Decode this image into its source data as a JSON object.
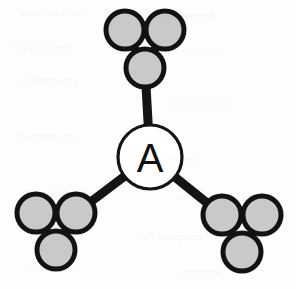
{
  "figure": {
    "background_color": "#fdfdfd",
    "width": 296,
    "height": 289
  },
  "palette": {
    "atom_fill": "#c9c9c9",
    "atom_stroke": "#121212",
    "bond_color": "#141414",
    "center_fill": "#ffffff",
    "center_stroke": "#141414",
    "label_color": "#111111"
  },
  "center_node": {
    "label": "A",
    "cx": 150,
    "cy": 157,
    "r": 32
  },
  "clusters": [
    {
      "id": "top",
      "name": "top-cluster",
      "atoms": [
        {
          "id": "top-left-atom",
          "cx": 125,
          "cy": 30,
          "r": 19
        },
        {
          "id": "top-right-atom",
          "cx": 165,
          "cy": 30,
          "r": 19
        },
        {
          "id": "top-apex-atom",
          "cx": 145,
          "cy": 68,
          "r": 19
        }
      ],
      "ring_bonds": [
        [
          0,
          1
        ],
        [
          1,
          2
        ],
        [
          2,
          0
        ]
      ],
      "link_atom_index": 2
    },
    {
      "id": "bottom-left",
      "name": "bottom-left-cluster",
      "atoms": [
        {
          "id": "bl-left-atom",
          "cx": 36,
          "cy": 213,
          "r": 19
        },
        {
          "id": "bl-right-atom",
          "cx": 76,
          "cy": 213,
          "r": 19
        },
        {
          "id": "bl-apex-atom",
          "cx": 56,
          "cy": 250,
          "r": 19
        }
      ],
      "ring_bonds": [
        [
          0,
          1
        ],
        [
          1,
          2
        ],
        [
          2,
          0
        ]
      ],
      "link_atom_index": 1
    },
    {
      "id": "bottom-right",
      "name": "bottom-right-cluster",
      "atoms": [
        {
          "id": "br-left-atom",
          "cx": 222,
          "cy": 215,
          "r": 19
        },
        {
          "id": "br-right-atom",
          "cx": 262,
          "cy": 215,
          "r": 19
        },
        {
          "id": "br-apex-atom",
          "cx": 242,
          "cy": 252,
          "r": 19
        }
      ],
      "ring_bonds": [
        [
          0,
          1
        ],
        [
          1,
          2
        ],
        [
          2,
          0
        ]
      ],
      "link_atom_index": 0
    }
  ],
  "core_bonds": [
    {
      "id": "bond-center-top",
      "from": "center",
      "to_cluster": "top"
    },
    {
      "id": "bond-center-bottom-left",
      "from": "center",
      "to_cluster": "bottom-left"
    },
    {
      "id": "bond-center-bottom-right",
      "from": "center",
      "to_cluster": "bottom-right"
    }
  ],
  "background_ghost_text": [
    {
      "text": "interaction of",
      "x": 18,
      "y": 6
    },
    {
      "text": "determined in",
      "x": 150,
      "y": 10
    },
    {
      "text": "the complex",
      "x": 12,
      "y": 40
    },
    {
      "text": "structure was",
      "x": 160,
      "y": 44
    },
    {
      "text": "reported for",
      "x": 20,
      "y": 74
    },
    {
      "text": "coordination",
      "x": 170,
      "y": 96
    },
    {
      "text": "geometry of",
      "x": 16,
      "y": 130
    },
    {
      "text": "the ligand",
      "x": 150,
      "y": 152
    },
    {
      "text": "binding sites",
      "x": 24,
      "y": 186
    },
    {
      "text": "with three",
      "x": 176,
      "y": 190
    },
    {
      "text": "equivalent",
      "x": 20,
      "y": 222
    },
    {
      "text": "groups in the",
      "x": 140,
      "y": 230
    },
    {
      "text": "solid state",
      "x": 28,
      "y": 262
    },
    {
      "text": "structure",
      "x": 180,
      "y": 266
    }
  ]
}
